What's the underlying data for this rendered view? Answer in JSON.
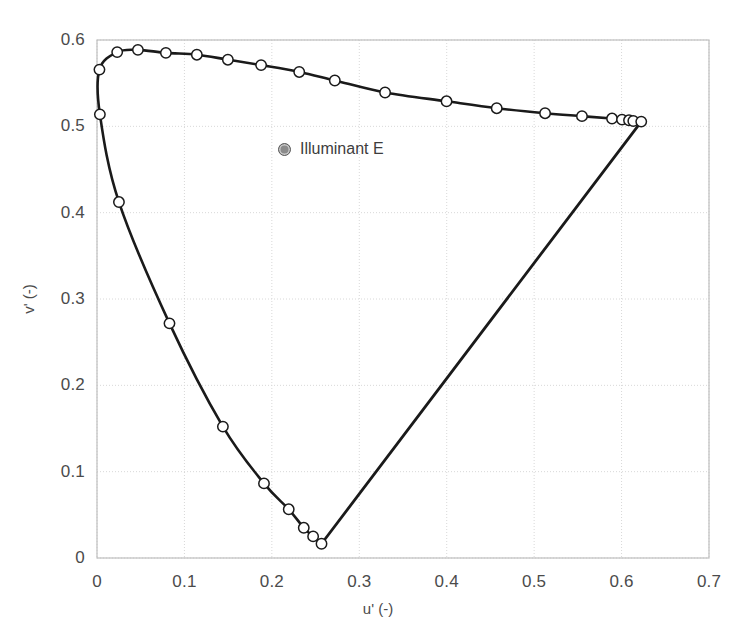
{
  "chart_data": {
    "type": "line",
    "title": "",
    "xlabel": "u' (-)",
    "ylabel": "v' (-)",
    "xlim": [
      0,
      0.7
    ],
    "ylim": [
      0,
      0.6
    ],
    "xticks": [
      "0",
      "0.1",
      "0.2",
      "0.3",
      "0.4",
      "0.5",
      "0.6",
      "0.7"
    ],
    "xtick_values": [
      0,
      0.1,
      0.2,
      0.3,
      0.4,
      0.5,
      0.6,
      0.7
    ],
    "yticks": [
      "0",
      "0.1",
      "0.2",
      "0.3",
      "0.4",
      "0.5",
      "0.6"
    ],
    "ytick_values": [
      0,
      0.1,
      0.2,
      0.3,
      0.4,
      0.5,
      0.6
    ],
    "grid": true,
    "legend_position": "inside-upper-center",
    "legend": [
      {
        "label": "Illuminant E",
        "marker": "filled-circle",
        "color": "#8b8b8b"
      }
    ],
    "series": [
      {
        "name": "Spectral locus (CIE 1976 u'v')",
        "marker": "open-circle",
        "line_color": "#1a1a1a",
        "marker_fill": "#ffffff",
        "marker_edge": "#1a1a1a",
        "closed": true,
        "points": [
          {
            "u": 0.2568,
            "v": 0.0165
          },
          {
            "u": 0.2472,
            "v": 0.025
          },
          {
            "u": 0.2365,
            "v": 0.035
          },
          {
            "u": 0.2193,
            "v": 0.0564
          },
          {
            "u": 0.191,
            "v": 0.0864
          },
          {
            "u": 0.144,
            "v": 0.1522
          },
          {
            "u": 0.0829,
            "v": 0.2718
          },
          {
            "u": 0.0251,
            "v": 0.4123
          },
          {
            "u": 0.0033,
            "v": 0.5139
          },
          {
            "u": 0.0028,
            "v": 0.5657
          },
          {
            "u": 0.0231,
            "v": 0.586
          },
          {
            "u": 0.0468,
            "v": 0.5886
          },
          {
            "u": 0.0788,
            "v": 0.5851
          },
          {
            "u": 0.1142,
            "v": 0.583
          },
          {
            "u": 0.1497,
            "v": 0.5772
          },
          {
            "u": 0.1877,
            "v": 0.5709
          },
          {
            "u": 0.2313,
            "v": 0.563
          },
          {
            "u": 0.272,
            "v": 0.5531
          },
          {
            "u": 0.3295,
            "v": 0.5392
          },
          {
            "u": 0.3998,
            "v": 0.529
          },
          {
            "u": 0.4572,
            "v": 0.521
          },
          {
            "u": 0.5125,
            "v": 0.5152
          },
          {
            "u": 0.5547,
            "v": 0.5118
          },
          {
            "u": 0.5891,
            "v": 0.509
          },
          {
            "u": 0.6005,
            "v": 0.5078
          },
          {
            "u": 0.6085,
            "v": 0.507
          },
          {
            "u": 0.6134,
            "v": 0.5062
          },
          {
            "u": 0.6225,
            "v": 0.5055
          }
        ],
        "purple_line": {
          "from": {
            "u": 0.6225,
            "v": 0.5055
          },
          "to": {
            "u": 0.2568,
            "v": 0.0165
          }
        }
      }
    ],
    "illuminant_e": {
      "u": 0.2105,
      "v": 0.4737
    },
    "colors": {
      "line": "#1a1a1a",
      "grid": "#d8d8d8",
      "frame": "#bfbfbf",
      "text": "#4b4b4b",
      "legend_marker": "#8b8b8b",
      "background": "#ffffff"
    }
  }
}
